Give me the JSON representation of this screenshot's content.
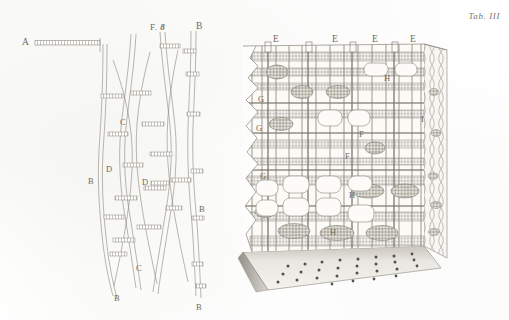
{
  "plate": {
    "tab_label": "Tab. III",
    "figure_label_prefix": "F.",
    "figure_label_number": "8",
    "ink_color": "#8b867c",
    "paper_color": "#fdfdfb",
    "label_color": "#6e6a62"
  },
  "left_figure": {
    "name": "longitudinal-fibers-figure",
    "labels": [
      {
        "id": "A",
        "text": "A",
        "x": 22,
        "y": 38,
        "note": "horizontal pitted fiber"
      },
      {
        "id": "B1",
        "text": "B",
        "x": 196,
        "y": 22,
        "note": "fiber top right"
      },
      {
        "id": "B2",
        "text": "B",
        "x": 88,
        "y": 177,
        "note": "fiber left"
      },
      {
        "id": "B3",
        "text": "B",
        "x": 199,
        "y": 205,
        "note": "fiber right"
      },
      {
        "id": "B4",
        "text": "B",
        "x": 114,
        "y": 294,
        "note": "fiber bottom left"
      },
      {
        "id": "B5",
        "text": "B",
        "x": 196,
        "y": 303,
        "note": "fiber bottom right"
      },
      {
        "id": "C1",
        "text": "C",
        "x": 120,
        "y": 118,
        "note": "vessel upper"
      },
      {
        "id": "C2",
        "text": "C",
        "x": 136,
        "y": 264,
        "note": "vessel lower"
      },
      {
        "id": "D1",
        "text": "D",
        "x": 106,
        "y": 165,
        "note": "pit row upper"
      },
      {
        "id": "D2",
        "text": "D",
        "x": 142,
        "y": 178,
        "note": "pit row lower"
      }
    ]
  },
  "right_figure": {
    "name": "wood-block-figure",
    "labels": [
      {
        "id": "E1",
        "text": "E",
        "x": 273,
        "y": 35
      },
      {
        "id": "E2",
        "text": "E",
        "x": 332,
        "y": 35
      },
      {
        "id": "E3",
        "text": "E",
        "x": 372,
        "y": 35
      },
      {
        "id": "E4",
        "text": "E",
        "x": 410,
        "y": 35
      },
      {
        "id": "G1",
        "text": "G",
        "x": 258,
        "y": 95
      },
      {
        "id": "G2",
        "text": "G",
        "x": 256,
        "y": 124
      },
      {
        "id": "G3",
        "text": "G",
        "x": 260,
        "y": 172
      },
      {
        "id": "F1",
        "text": "F",
        "x": 359,
        "y": 130
      },
      {
        "id": "F2",
        "text": "F",
        "x": 345,
        "y": 152
      },
      {
        "id": "H1",
        "text": "H",
        "x": 384,
        "y": 74
      },
      {
        "id": "H2",
        "text": "H",
        "x": 349,
        "y": 191
      },
      {
        "id": "H3",
        "text": "H",
        "x": 330,
        "y": 228
      },
      {
        "id": "I1",
        "text": "I",
        "x": 421,
        "y": 115
      }
    ]
  }
}
